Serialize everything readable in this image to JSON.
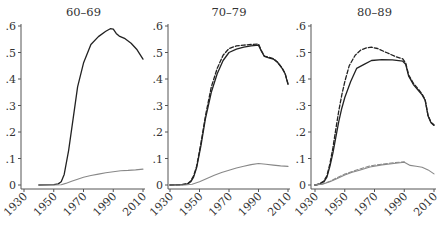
{
  "chart_data": [
    {
      "type": "line",
      "title": "60–69",
      "xlabel": "",
      "ylabel": "",
      "ylim": [
        0,
        0.6
      ],
      "xlim": [
        1930,
        2010
      ],
      "yticks": [
        0,
        0.1,
        0.2,
        0.3,
        0.4,
        0.5,
        0.6
      ],
      "ytick_labels": [
        "0",
        ".1",
        ".2",
        ".3",
        ".4",
        ".5",
        ".6"
      ],
      "xticks": [
        1930,
        1950,
        1970,
        1990,
        2010
      ],
      "xtick_labels": [
        "1930",
        "1950",
        "1970",
        "1990",
        "2010"
      ],
      "grid": false,
      "legend": null,
      "series": [
        {
          "name": "dark-solid",
          "style": "solid",
          "color": "#222222",
          "x": [
            1940,
            1950,
            1953,
            1955,
            1957,
            1960,
            1963,
            1966,
            1970,
            1975,
            1980,
            1985,
            1988,
            1990,
            1992,
            1994,
            1998,
            2002,
            2006,
            2010
          ],
          "values": [
            0,
            0.001,
            0.004,
            0.012,
            0.04,
            0.13,
            0.25,
            0.37,
            0.46,
            0.53,
            0.56,
            0.58,
            0.59,
            0.588,
            0.572,
            0.562,
            0.552,
            0.535,
            0.51,
            0.475
          ]
        },
        {
          "name": "gray-solid",
          "style": "solid",
          "color": "#888888",
          "x": [
            1940,
            1950,
            1955,
            1958,
            1962,
            1966,
            1970,
            1975,
            1980,
            1985,
            1990,
            1995,
            2000,
            2005,
            2010
          ],
          "values": [
            0,
            0,
            0.001,
            0.006,
            0.014,
            0.022,
            0.029,
            0.036,
            0.041,
            0.046,
            0.05,
            0.054,
            0.055,
            0.057,
            0.06
          ]
        }
      ]
    },
    {
      "type": "line",
      "title": "70–79",
      "xlabel": "",
      "ylabel": "",
      "ylim": [
        0,
        0.6
      ],
      "xlim": [
        1930,
        2010
      ],
      "yticks": [
        0,
        0.1,
        0.2,
        0.3,
        0.4,
        0.5,
        0.6
      ],
      "ytick_labels": [
        "0",
        ".1",
        ".2",
        ".3",
        ".4",
        ".5",
        ".6"
      ],
      "xticks": [
        1930,
        1950,
        1970,
        1990,
        2010
      ],
      "xtick_labels": [
        "1930",
        "1950",
        "1970",
        "1990",
        "2010"
      ],
      "grid": false,
      "legend": null,
      "series": [
        {
          "name": "dark-solid",
          "style": "solid",
          "color": "#222222",
          "x": [
            1930,
            1938,
            1942,
            1944,
            1946,
            1948,
            1951,
            1954,
            1958,
            1962,
            1966,
            1970,
            1975,
            1980,
            1985,
            1990,
            1992,
            1994,
            1997,
            2000,
            2003,
            2006,
            2008,
            2010
          ],
          "values": [
            0,
            0.001,
            0.004,
            0.012,
            0.03,
            0.065,
            0.15,
            0.25,
            0.35,
            0.42,
            0.47,
            0.5,
            0.513,
            0.52,
            0.525,
            0.528,
            0.505,
            0.485,
            0.48,
            0.475,
            0.462,
            0.44,
            0.42,
            0.38
          ]
        },
        {
          "name": "dark-dashed",
          "style": "dashed",
          "color": "#222222",
          "x": [
            1930,
            1938,
            1942,
            1944,
            1946,
            1948,
            1951,
            1954,
            1958,
            1962,
            1966,
            1970,
            1975,
            1980,
            1985,
            1990,
            1992,
            1994,
            1997,
            2000,
            2003,
            2006,
            2008,
            2010
          ],
          "values": [
            0,
            0.001,
            0.005,
            0.015,
            0.035,
            0.07,
            0.16,
            0.26,
            0.37,
            0.44,
            0.49,
            0.515,
            0.525,
            0.528,
            0.53,
            0.532,
            0.507,
            0.486,
            0.482,
            0.477,
            0.463,
            0.442,
            0.421,
            0.382
          ]
        },
        {
          "name": "gray-solid",
          "style": "solid",
          "color": "#888888",
          "x": [
            1930,
            1940,
            1945,
            1950,
            1955,
            1960,
            1965,
            1970,
            1975,
            1980,
            1985,
            1990,
            1995,
            2000,
            2005,
            2010
          ],
          "values": [
            0,
            0,
            0.003,
            0.012,
            0.025,
            0.037,
            0.047,
            0.056,
            0.064,
            0.071,
            0.077,
            0.081,
            0.078,
            0.075,
            0.072,
            0.07
          ]
        }
      ]
    },
    {
      "type": "line",
      "title": "80–89",
      "xlabel": "",
      "ylabel": "",
      "ylim": [
        0,
        0.6
      ],
      "xlim": [
        1930,
        2010
      ],
      "yticks": [
        0,
        0.1,
        0.2,
        0.3,
        0.4,
        0.5,
        0.6
      ],
      "ytick_labels": [
        "0",
        ".1",
        ".2",
        ".3",
        ".4",
        ".5",
        ".6"
      ],
      "xticks": [
        1930,
        1950,
        1970,
        1990,
        2010
      ],
      "xtick_labels": [
        "1930",
        "1950",
        "1970",
        "1990",
        "2010"
      ],
      "grid": false,
      "legend": null,
      "series": [
        {
          "name": "dark-solid",
          "style": "solid",
          "color": "#222222",
          "x": [
            1930,
            1933,
            1936,
            1938,
            1940,
            1942,
            1944,
            1946,
            1948,
            1950,
            1954,
            1958,
            1963,
            1968,
            1975,
            1982,
            1989,
            1991,
            1993,
            1996,
            1999,
            2002,
            2004,
            2006,
            2008,
            2010
          ],
          "values": [
            0,
            0.003,
            0.012,
            0.03,
            0.07,
            0.12,
            0.18,
            0.24,
            0.29,
            0.33,
            0.39,
            0.44,
            0.455,
            0.47,
            0.473,
            0.472,
            0.467,
            0.455,
            0.41,
            0.38,
            0.36,
            0.34,
            0.32,
            0.26,
            0.235,
            0.225
          ]
        },
        {
          "name": "dark-dashed",
          "style": "dashed",
          "color": "#222222",
          "x": [
            1930,
            1933,
            1936,
            1938,
            1940,
            1942,
            1944,
            1946,
            1948,
            1950,
            1953,
            1957,
            1961,
            1965,
            1968,
            1972,
            1978,
            1984,
            1989,
            1991,
            1993,
            1996,
            1999,
            2002,
            2004,
            2006,
            2008,
            2010
          ],
          "values": [
            0,
            0.004,
            0.015,
            0.035,
            0.08,
            0.14,
            0.21,
            0.28,
            0.34,
            0.39,
            0.45,
            0.49,
            0.51,
            0.518,
            0.52,
            0.515,
            0.5,
            0.485,
            0.476,
            0.46,
            0.415,
            0.385,
            0.365,
            0.343,
            0.323,
            0.262,
            0.237,
            0.227
          ]
        },
        {
          "name": "gray-solid",
          "style": "solid",
          "color": "#888888",
          "x": [
            1930,
            1935,
            1940,
            1945,
            1950,
            1955,
            1960,
            1967,
            1975,
            1983,
            1990,
            1994,
            1998,
            2002,
            2006,
            2010
          ],
          "values": [
            0,
            0.003,
            0.012,
            0.025,
            0.038,
            0.048,
            0.056,
            0.068,
            0.076,
            0.081,
            0.086,
            0.074,
            0.071,
            0.067,
            0.057,
            0.042
          ]
        },
        {
          "name": "gray-dashed",
          "style": "dashed",
          "color": "#888888",
          "x": [
            1930,
            1935,
            1940,
            1945,
            1950,
            1955,
            1960,
            1967,
            1975,
            1983,
            1990
          ],
          "values": [
            0,
            0.004,
            0.014,
            0.028,
            0.041,
            0.051,
            0.06,
            0.072,
            0.079,
            0.084,
            0.088
          ]
        }
      ]
    }
  ],
  "layout": {
    "panels": [
      {
        "x_1930": 24,
        "x_2010": 143,
        "y_axis_x": 21
      },
      {
        "x_1930": 170,
        "x_2010": 288,
        "y_axis_x": 168
      },
      {
        "x_1930": 315,
        "x_2010": 434,
        "y_axis_x": 311
      }
    ],
    "y_zero": 185,
    "y_top": 26,
    "x_axis_y": 189
  }
}
